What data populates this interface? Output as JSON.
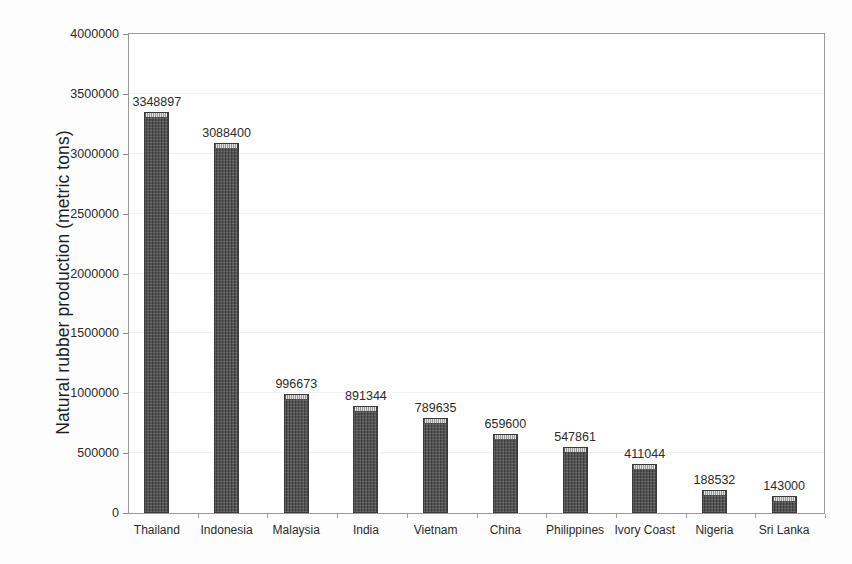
{
  "chart_data": {
    "type": "bar",
    "title": "",
    "subtitle": "",
    "xlabel": "",
    "ylabel": "Natural rubber production (metric tons)",
    "categories": [
      "Thailand",
      "Indonesia",
      "Malaysia",
      "India",
      "Vietnam",
      "China",
      "Philippines",
      "Ivory Coast",
      "Nigeria",
      "Sri Lanka"
    ],
    "values": [
      3348897,
      3088400,
      996673,
      891344,
      789635,
      659600,
      547861,
      411044,
      188532,
      143000
    ],
    "value_labels": [
      "3348897",
      "3088400",
      "996673",
      "891344",
      "789635",
      "659600",
      "547861",
      "411044",
      "188532",
      "143000"
    ],
    "ylim": [
      0,
      4000000
    ],
    "y_ticks": [
      0,
      500000,
      1000000,
      1500000,
      2000000,
      2500000,
      3000000,
      3500000,
      4000000
    ],
    "y_tick_labels": [
      "0",
      "500000",
      "1000000",
      "1500000",
      "2000000",
      "2500000",
      "3000000",
      "3500000",
      "4000000"
    ],
    "grid": true,
    "grid_axis": "y",
    "legend": false,
    "legend_position": "none",
    "bar_color": "#4d4d4d",
    "bar_edge_color": "#3a3a3a",
    "plot_border_color": "#9a9a9a",
    "gridline_color": "#f0f0f0",
    "text_color": "#2b2b2b",
    "background_color": "#ffffff"
  }
}
